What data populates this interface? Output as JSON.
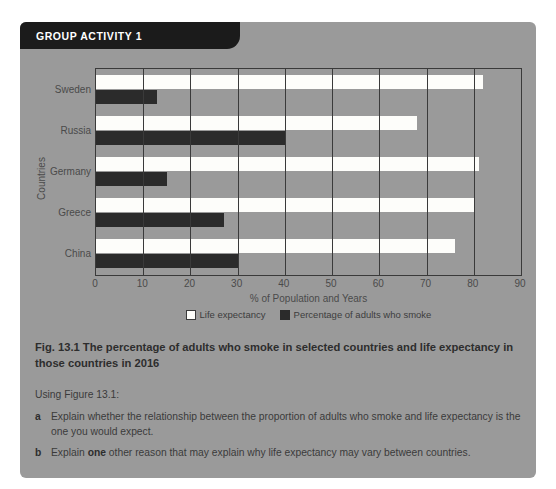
{
  "panel": {
    "header_label": "GROUP ACTIVITY 1"
  },
  "chart_data": {
    "type": "bar",
    "orientation": "horizontal",
    "grouped": true,
    "categories": [
      "China",
      "Greece",
      "Germany",
      "Russia",
      "Sweden"
    ],
    "series": [
      {
        "name": "Life expectancy",
        "values": [
          76,
          80,
          81,
          68,
          82
        ],
        "color": "#fdfdfa"
      },
      {
        "name": "Percentage of adults who smoke",
        "values": [
          30,
          27,
          15,
          40,
          13
        ],
        "color": "#2b2b2b"
      }
    ],
    "title": "",
    "xlabel": "% of Population and Years",
    "ylabel": "Countries",
    "xlim": [
      0,
      90
    ],
    "xticks": [
      0,
      10,
      20,
      30,
      40,
      50,
      60,
      70,
      80,
      90
    ],
    "grid": true,
    "legend_position": "bottom"
  },
  "caption": "Fig. 13.1 The percentage of adults who smoke in selected countries and life expectancy in those countries in 2016",
  "questions": {
    "intro": "Using Figure 13.1:",
    "items": [
      {
        "marker": "a",
        "text_before": "Explain whether the relationship between the proportion of adults who smoke and life expectancy is the one you would expect.",
        "bold": "",
        "text_after": ""
      },
      {
        "marker": "b",
        "text_before": "Explain ",
        "bold": "one",
        "text_after": " other reason that may explain why life expectancy may vary between countries."
      }
    ]
  },
  "colors": {
    "panel_bg": "#9a9a9a",
    "header_bg": "#1b1b1b",
    "axis": "#3a3a3a"
  }
}
